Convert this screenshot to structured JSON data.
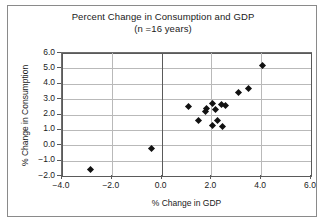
{
  "chart_data": {
    "type": "scatter",
    "title": "Percent Change in Consumption and GDP",
    "subtitle": "(n =16 years)",
    "xlabel": "% Change in GDP",
    "ylabel": "% Change in Consumption",
    "xlim": [
      -4.0,
      6.0
    ],
    "ylim": [
      -2.0,
      6.0
    ],
    "xticks": [
      "-4.0",
      "-2.0",
      "0.0",
      "2.0",
      "4.0",
      "6.0"
    ],
    "xtick_values": [
      -4.0,
      -2.0,
      0.0,
      2.0,
      4.0,
      6.0
    ],
    "yticks": [
      "6.0",
      "5.0",
      "4.0",
      "3.0",
      "2.0",
      "1.0",
      "0.0",
      "-1.0",
      "-2.0"
    ],
    "ytick_values": [
      6.0,
      5.0,
      4.0,
      3.0,
      2.0,
      1.0,
      0.0,
      -1.0,
      -2.0
    ],
    "grid": true,
    "legend": "none",
    "marker": "diamond",
    "marker_color": "#111111",
    "n": 16,
    "points": [
      {
        "x": -2.85,
        "y": -1.6
      },
      {
        "x": -0.4,
        "y": -0.2
      },
      {
        "x": 1.1,
        "y": 2.5
      },
      {
        "x": 1.5,
        "y": 1.6
      },
      {
        "x": 1.75,
        "y": 2.2
      },
      {
        "x": 1.8,
        "y": 2.4
      },
      {
        "x": 2.05,
        "y": 1.3
      },
      {
        "x": 2.25,
        "y": 1.6
      },
      {
        "x": 2.05,
        "y": 2.7
      },
      {
        "x": 2.15,
        "y": 2.3
      },
      {
        "x": 2.45,
        "y": 1.25
      },
      {
        "x": 2.4,
        "y": 2.65
      },
      {
        "x": 2.55,
        "y": 2.6
      },
      {
        "x": 3.1,
        "y": 3.4
      },
      {
        "x": 3.5,
        "y": 3.7
      },
      {
        "x": 4.05,
        "y": 5.2
      }
    ]
  }
}
